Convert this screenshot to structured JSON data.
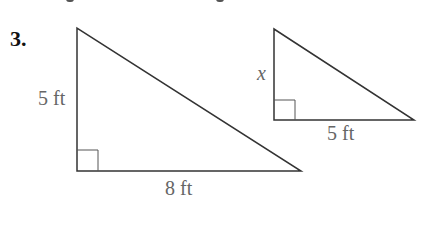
{
  "problem": {
    "number": "3.",
    "triangle_large": {
      "vertical_leg_label": "5 ft",
      "horizontal_leg_label": "8 ft",
      "right_angle": true
    },
    "triangle_small": {
      "vertical_leg_label": "x",
      "horizontal_leg_label": "5 ft",
      "right_angle": true
    }
  },
  "colors": {
    "line": "#333333",
    "label": "#666666",
    "number": "#111111"
  }
}
